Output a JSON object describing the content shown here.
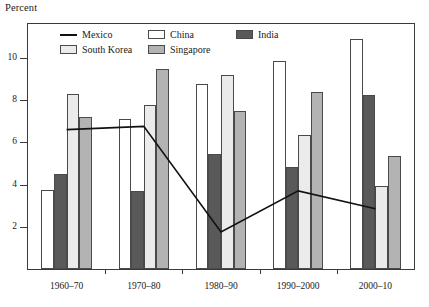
{
  "chart_data": {
    "type": "bar",
    "title": "",
    "ylabel": "Percent",
    "xlabel": "",
    "categories": [
      "1960–70",
      "1970–80",
      "1980–90",
      "1990–2000",
      "2000–10"
    ],
    "ylim": [
      0,
      11.6
    ],
    "yticks": [
      2,
      4,
      6,
      8,
      10
    ],
    "ytick_labels": [
      "2",
      "4",
      "6",
      "8",
      "10"
    ],
    "grid": false,
    "legend_position": "top-center-inside",
    "series": [
      {
        "name": "China",
        "type": "bar",
        "color": "#ffffff",
        "values": [
          3.75,
          7.1,
          8.75,
          9.85,
          10.9
        ]
      },
      {
        "name": "India",
        "type": "bar",
        "color": "#595959",
        "values": [
          4.5,
          3.7,
          5.45,
          4.85,
          8.25
        ]
      },
      {
        "name": "South Korea",
        "type": "bar",
        "color": "#ebebeb",
        "values": [
          8.3,
          7.75,
          9.2,
          6.35,
          3.95
        ]
      },
      {
        "name": "Singapore",
        "type": "bar",
        "color": "#b3b3b3",
        "values": [
          7.2,
          9.45,
          7.5,
          8.4,
          5.35
        ]
      },
      {
        "name": "Mexico",
        "type": "line",
        "color": "#111111",
        "values": [
          6.6,
          6.75,
          1.75,
          3.7,
          2.85
        ]
      }
    ]
  },
  "legend": {
    "rows": [
      [
        {
          "label": "Mexico",
          "swatch": "line-swatch"
        },
        {
          "label": "China",
          "swatch": "box-swatch"
        },
        {
          "label": "India",
          "swatch": "box-swatch"
        }
      ],
      [
        {
          "label": "South Korea",
          "swatch": "box-swatch"
        },
        {
          "label": "Singapore",
          "swatch": "box-swatch"
        }
      ]
    ]
  }
}
